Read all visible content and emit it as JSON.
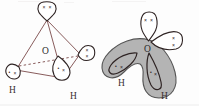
{
  "figure": {
    "background_color": "#fdfdfd"
  },
  "panels": [
    {
      "id": "left",
      "name": "tetrahedral-orbital-diagram",
      "description": "Tetrahedral arrangement of four sp3 hybrid orbitals around central oxygen",
      "central_atom": "O",
      "geometry": "tetrahedral",
      "outline_color": "#7a4a4a",
      "lobe_stroke_color": "#2e2323",
      "lobe_fill_color": "#ffffff",
      "tetrahedron_edges": [
        {
          "name": "edge-top-to-left",
          "style": "solid"
        },
        {
          "name": "edge-top-to-right",
          "style": "solid"
        },
        {
          "name": "edge-top-to-front",
          "style": "solid"
        },
        {
          "name": "edge-left-to-front",
          "style": "solid"
        },
        {
          "name": "edge-right-to-front",
          "style": "solid"
        },
        {
          "name": "edge-left-to-right",
          "style": "dashed"
        }
      ],
      "lobes": [
        {
          "name": "lobe-top-lone-pair",
          "position": "top",
          "pair_type": "lone pair",
          "marks": "x x"
        },
        {
          "name": "lobe-right-lone-pair",
          "position": "right",
          "pair_type": "lone pair",
          "marks": "x x"
        },
        {
          "name": "lobe-lower-left-bonding",
          "position": "lower-left",
          "pair_type": "bonding pair",
          "marks": ". x"
        },
        {
          "name": "lobe-lower-right-bonding",
          "position": "lower-right",
          "pair_type": "bonding pair",
          "marks": ". x"
        }
      ],
      "labels": {
        "oxygen": "O",
        "hydrogen_left": "H",
        "hydrogen_right": "H"
      }
    },
    {
      "id": "right",
      "name": "bent-molecular-shape-diagram",
      "description": "Shaded bent (V-shaped) electron cloud of the water molecule with lone pairs",
      "central_atom": "O",
      "geometry": "bent",
      "cloud_fill_color": "#b4b4b4",
      "cloud_stroke_color": "#555555",
      "lobe_stroke_color": "#2e2323",
      "lobe_fill_color": "#ffffff",
      "lobes": [
        {
          "name": "lobe-top-lone-pair",
          "position": "top",
          "pair_type": "lone pair",
          "marks": "x x",
          "shaded": false
        },
        {
          "name": "lobe-right-lone-pair",
          "position": "upper-right",
          "pair_type": "lone pair",
          "marks": "x x",
          "shaded": false
        },
        {
          "name": "lobe-left-bonding",
          "position": "left-arm",
          "pair_type": "bonding pair",
          "marks": ". x",
          "shaded": true
        },
        {
          "name": "lobe-right-bonding",
          "position": "right-arm",
          "pair_type": "bonding pair",
          "marks": ". x",
          "shaded": true
        }
      ],
      "labels": {
        "oxygen": "O",
        "hydrogen_left": "H",
        "hydrogen_right": "H"
      }
    }
  ],
  "electron_marks": {
    "cross": "×",
    "dot": "•"
  }
}
